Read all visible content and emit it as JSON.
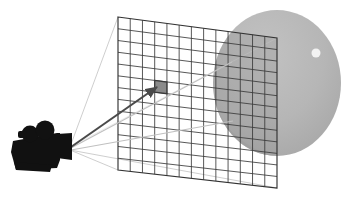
{
  "figure": {
    "type": "diagram",
    "width": 355,
    "height": 203,
    "background_color": "#ffffff"
  },
  "colors": {
    "background": "#ffffff",
    "camera_body": "#111111",
    "sphere_fill": "#b4b4b4",
    "sphere_shadow_side": "#a8a8a8",
    "sphere_behind_grid_tint": "#9a9a9a",
    "sphere_highlight": "#f2f2f2",
    "grid_line": "#3a3a3a",
    "grid_line_over_sphere": "#2f2f2f",
    "frustum_line": "#c8c8c8",
    "primary_ray": "#4a4a4a",
    "secondary_ray": "#c0c0c0",
    "pixel_highlight_stroke": "#3a3a3a",
    "pixel_highlight_fill": "#8a8a8a"
  },
  "camera": {
    "label": "movie-camera",
    "apex": {
      "x": 70,
      "y": 147
    },
    "body": {
      "x": 12,
      "y": 134,
      "width": 52,
      "height": 36
    },
    "reels": [
      {
        "cx": 30,
        "cy": 134,
        "r": 8.5
      },
      {
        "cx": 45,
        "cy": 130,
        "r": 9.5
      }
    ],
    "lens": {
      "from_x": 57,
      "to_x": 72,
      "half_height": 13
    }
  },
  "image_plane": {
    "label": "image-plane-pixel-grid",
    "columns": 13,
    "rows": 13,
    "corners": {
      "top_left": {
        "x": 118,
        "y": 17
      },
      "top_right": {
        "x": 277,
        "y": 38
      },
      "bottom_right": {
        "x": 277,
        "y": 188
      },
      "bottom_left": {
        "x": 118,
        "y": 170
      }
    }
  },
  "highlighted_pixel": {
    "label": "sample-pixel",
    "column": 3,
    "row": 5,
    "center": {
      "x": 156,
      "y": 87
    }
  },
  "sphere": {
    "label": "scene-sphere",
    "center": {
      "x": 277,
      "y": 83
    },
    "radius_x": 64,
    "radius_y": 73,
    "highlight": {
      "cx": 316,
      "cy": 53,
      "r": 4.5
    }
  },
  "rays": {
    "primary": {
      "label": "primary-ray",
      "from": {
        "x": 71,
        "y": 147
      },
      "to": {
        "x": 157,
        "y": 87
      }
    },
    "secondary": [
      {
        "label": "secondary-ray-upper",
        "from": {
          "x": 71,
          "y": 148
        },
        "to": {
          "x": 232,
          "y": 62
        }
      },
      {
        "label": "secondary-ray-lower",
        "from": {
          "x": 71,
          "y": 150
        },
        "to": {
          "x": 233,
          "y": 121
        }
      }
    ],
    "frustum": [
      {
        "label": "frustum-edge-top-left",
        "from": {
          "x": 70,
          "y": 147
        },
        "to": {
          "x": 118,
          "y": 17
        }
      },
      {
        "label": "frustum-edge-bottom-left",
        "from": {
          "x": 70,
          "y": 150
        },
        "to": {
          "x": 118,
          "y": 170
        }
      },
      {
        "label": "frustum-edge-bottom-right",
        "from": {
          "x": 70,
          "y": 150
        },
        "to": {
          "x": 277,
          "y": 188
        }
      }
    ]
  }
}
